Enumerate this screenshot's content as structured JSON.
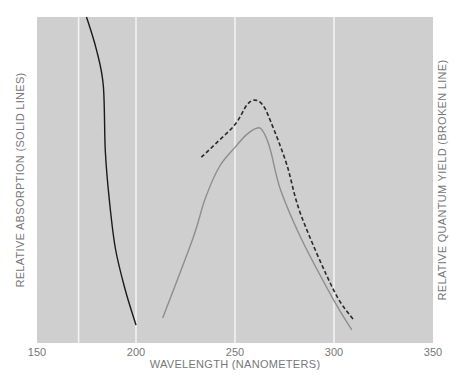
{
  "chart_data": {
    "type": "line",
    "title": "",
    "xlabel": "WAVELENGTH (NANOMETERS)",
    "ylabel_left": "RELATIVE ABSORPTION (SOLID LINES)",
    "ylabel_right": "RELATIVE QUANTUM YIELD (BROKEN LINE)",
    "xlim": [
      150,
      350
    ],
    "ylim": [
      0,
      1
    ],
    "x_ticks": [
      150,
      200,
      250,
      300,
      350
    ],
    "x_tick_labels": [
      "150",
      "200",
      "250",
      "300",
      "350"
    ],
    "vertical_gridlines": [
      171,
      200,
      250,
      300
    ],
    "grid": true,
    "background_color": "#cfcfcf",
    "gridline_color": "#f4f4f4",
    "series": [
      {
        "name": "Absorption (solid, black)",
        "style": "solid",
        "color": "#1a1a1a",
        "points": [
          [
            175,
            1.0
          ],
          [
            180,
            0.9
          ],
          [
            183.5,
            0.79
          ],
          [
            184.5,
            0.59
          ],
          [
            186.5,
            0.44
          ],
          [
            189.6,
            0.29
          ],
          [
            194.7,
            0.16
          ],
          [
            200,
            0.055
          ]
        ]
      },
      {
        "name": "Absorption (solid, gray)",
        "style": "solid",
        "color": "#8e8e8e",
        "points": [
          [
            213.5,
            0.077
          ],
          [
            228.7,
            0.32
          ],
          [
            234.8,
            0.44
          ],
          [
            242,
            0.54
          ],
          [
            250,
            0.6
          ],
          [
            256,
            0.64
          ],
          [
            262,
            0.66
          ],
          [
            265,
            0.64
          ],
          [
            268,
            0.59
          ],
          [
            273,
            0.47
          ],
          [
            283.5,
            0.32
          ],
          [
            300,
            0.13
          ],
          [
            309,
            0.04
          ]
        ]
      },
      {
        "name": "Quantum yield (broken)",
        "style": "dashed",
        "color": "#2a2a2a",
        "points": [
          [
            233,
            0.57
          ],
          [
            240,
            0.61
          ],
          [
            250,
            0.67
          ],
          [
            256,
            0.73
          ],
          [
            260,
            0.745
          ],
          [
            264,
            0.73
          ],
          [
            268,
            0.68
          ],
          [
            276,
            0.55
          ],
          [
            283.5,
            0.39
          ],
          [
            300,
            0.16
          ],
          [
            310,
            0.07
          ]
        ]
      }
    ]
  }
}
